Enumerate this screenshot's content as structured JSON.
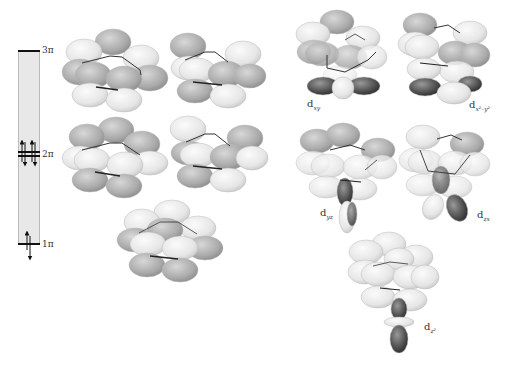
{
  "energy_diagram": {
    "levels": [
      {
        "label": "3π",
        "y": 50,
        "electrons": 0
      },
      {
        "label": "2π",
        "y": 153,
        "electrons": 4
      },
      {
        "label": "1π",
        "y": 244,
        "electrons": 2
      }
    ]
  },
  "orbital_labels": {
    "dxy": {
      "base": "d",
      "sub": "xy"
    },
    "dx2y2": {
      "base": "d",
      "sub": "x²–y²"
    },
    "dyz": {
      "base": "d",
      "sub": "yz"
    },
    "dzx": {
      "base": "d",
      "sub": "zx"
    },
    "dz2": {
      "base": "d",
      "sub": "z²"
    }
  },
  "colors": {
    "background": "#ffffff",
    "lobe_light": "#ececec",
    "lobe_dark": "#a8a8a8",
    "d_lobe_dark": "#444444",
    "bond": "#222222",
    "bar": "#e8e8e8"
  }
}
